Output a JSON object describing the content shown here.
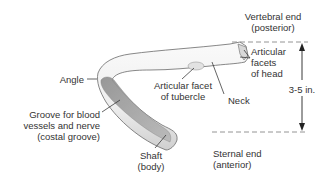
{
  "diagram": {
    "labels": {
      "vertebral_end": [
        "Vertebral end",
        "(posterior)"
      ],
      "articular_facets_head": [
        "Articular",
        "facets",
        "of head"
      ],
      "angle": [
        "Angle"
      ],
      "articular_facet_tubercle": [
        "Articular facet",
        "of tubercle"
      ],
      "neck": [
        "Neck"
      ],
      "groove": [
        "Groove for blood",
        "vessels and nerve",
        "(costal groove)"
      ],
      "shaft": [
        "Shaft",
        "(body)"
      ],
      "sternal_end": [
        "Sternal end",
        "(anterior)"
      ],
      "measurement": "3-5 in."
    },
    "colors": {
      "bone_light": "#f4f4f4",
      "bone_shade": "#c8c8c8",
      "groove": "#a0a0a0",
      "outline": "#6a6a6a",
      "text": "#333333",
      "leader": "#222222",
      "dash": "#888888"
    }
  }
}
